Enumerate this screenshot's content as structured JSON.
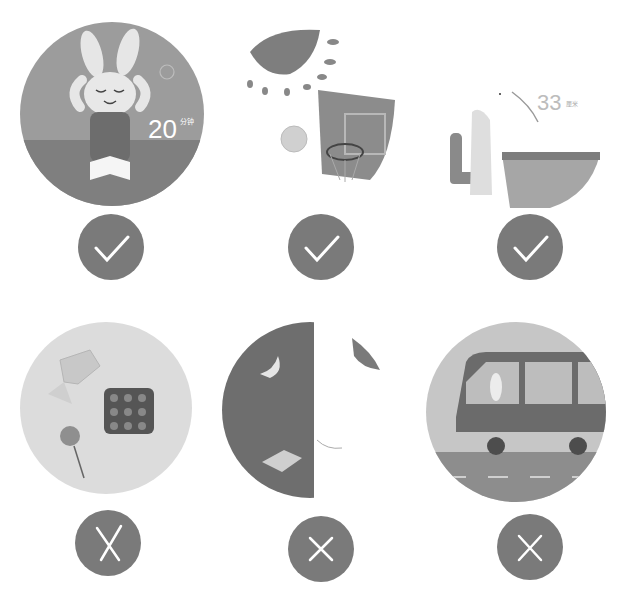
{
  "colors": {
    "badge": "#7a7a7a",
    "mark": "#ffffff",
    "circle_light": "#d8d8d8",
    "circle_mid": "#a9a9a9",
    "circle_dark": "#7d7d7d"
  },
  "rows": [
    {
      "status": "correct",
      "items": [
        {
          "scene": "rabbit-eye-exercise-after-reading",
          "text_value": "20",
          "text_unit": "分钟",
          "mark": "check"
        },
        {
          "scene": "outdoor-basketball-in-sun",
          "mark": "check"
        },
        {
          "scene": "rabbit-sitting-desk-33cm",
          "text_value": "33",
          "text_unit": "厘米",
          "mark": "check"
        }
      ]
    },
    {
      "status": "wrong",
      "items": [
        {
          "scene": "eating-candy-sweets",
          "mark": "cross"
        },
        {
          "scene": "reading-in-dark-night",
          "mark": "cross"
        },
        {
          "scene": "rabbit-reading-on-moving-bus",
          "mark": "cross"
        }
      ]
    }
  ]
}
